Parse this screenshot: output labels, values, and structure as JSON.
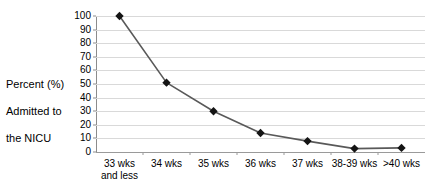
{
  "chart_data": {
    "type": "line",
    "title": "",
    "xlabel": "",
    "ylabel": "Percent (%) Admitted to the NICU",
    "ylim": [
      0,
      100
    ],
    "ytick_step": 10,
    "yticks": [
      100,
      90,
      80,
      70,
      60,
      50,
      40,
      30,
      20,
      10,
      0
    ],
    "grid": true,
    "legend": false,
    "legend_position": "none",
    "categories": [
      "33 wks\nand less",
      "34 wks",
      "35 wks",
      "36 wks",
      "37 wks",
      "38-39 wks",
      ">40 wks"
    ],
    "values": [
      100,
      51,
      30,
      14,
      8,
      2.5,
      3
    ],
    "series": [
      {
        "name": "Percent (%) Admitted to the NICU",
        "values": [
          100,
          51,
          30,
          14,
          8,
          2.5,
          3
        ]
      }
    ],
    "marker": "diamond",
    "colors": {
      "line": "#595959",
      "marker": "#141414",
      "gridline": "#d9d9d9",
      "axis": "#8c8c8c",
      "text": "#000000",
      "background": "#ffffff"
    }
  },
  "y_axis_caption": {
    "line1": "Percent (%)",
    "line2": "Admitted to",
    "line3": "the NICU"
  }
}
